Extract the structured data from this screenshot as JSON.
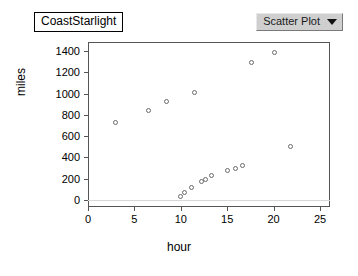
{
  "title": {
    "text": "CoastStarlight"
  },
  "dropdown": {
    "label": "Scatter Plot",
    "caret_icon": "chevron-down-icon"
  },
  "chart_data": {
    "type": "scatter",
    "title": "CoastStarlight",
    "xlabel": "hour",
    "ylabel": "miles",
    "xlim": [
      0,
      26
    ],
    "ylim": [
      -40,
      1450
    ],
    "xticks": [
      0,
      5,
      10,
      15,
      20,
      25
    ],
    "yticks": [
      0,
      200,
      400,
      600,
      800,
      1000,
      1200,
      1400
    ],
    "grid": "y-zero-only",
    "legend": "none",
    "marker": {
      "shape": "circle-open",
      "edge_color": "#6a6a6a",
      "fill_color": "#ffffff",
      "size": 5
    },
    "points": [
      {
        "x": 3.0,
        "y": 730
      },
      {
        "x": 6.5,
        "y": 840
      },
      {
        "x": 8.5,
        "y": 930
      },
      {
        "x": 11.5,
        "y": 1010
      },
      {
        "x": 17.6,
        "y": 1290
      },
      {
        "x": 20.1,
        "y": 1390
      },
      {
        "x": 21.8,
        "y": 500
      },
      {
        "x": 10.0,
        "y": 30
      },
      {
        "x": 10.4,
        "y": 70
      },
      {
        "x": 11.2,
        "y": 120
      },
      {
        "x": 12.2,
        "y": 170
      },
      {
        "x": 12.7,
        "y": 190
      },
      {
        "x": 13.3,
        "y": 230
      },
      {
        "x": 15.0,
        "y": 280
      },
      {
        "x": 15.9,
        "y": 300
      },
      {
        "x": 16.7,
        "y": 320
      }
    ]
  },
  "colors": {
    "frame": "#555555",
    "gridline": "#d8d8d8",
    "dropdown_face": "#cfcfcf"
  }
}
